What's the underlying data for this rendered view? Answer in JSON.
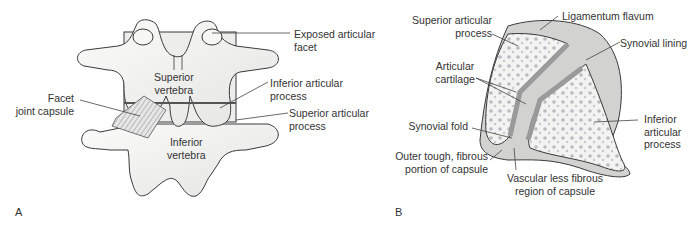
{
  "figure": {
    "panel_a": {
      "letter": "A",
      "labels": {
        "exposed_facet": [
          "Exposed articular",
          "facet"
        ],
        "superior_vertebra": [
          "Superior",
          "vertebra"
        ],
        "inferior_articular": [
          "Inferior articular",
          "process"
        ],
        "facet_capsule": [
          "Facet",
          "joint capsule"
        ],
        "superior_articular": [
          "Superior articular",
          "process"
        ],
        "inferior_vertebra": [
          "Inferior",
          "vertebra"
        ]
      }
    },
    "panel_b": {
      "letter": "B",
      "labels": {
        "superior_articular": [
          "Superior articular",
          "process"
        ],
        "ligamentum_flavum": [
          "Ligamentum flavum"
        ],
        "synovial_lining": [
          "Synovial lining"
        ],
        "articular_cartilage": [
          "Articular",
          "cartilage"
        ],
        "inferior_articular": [
          "Inferior",
          "articular",
          "process"
        ],
        "synovial_fold": [
          "Synovial fold"
        ],
        "outer_capsule": [
          "Outer tough, fibrous",
          "portion of capsule"
        ],
        "vascular_region": [
          "Vascular less fibrous",
          "region of capsule"
        ]
      }
    },
    "colors": {
      "bone_fill": "#f2f2f0",
      "outline": "#3a3a3a",
      "leader": "#444444",
      "pore": "#b9bcbf",
      "capsule": "#c9c9c9"
    }
  }
}
